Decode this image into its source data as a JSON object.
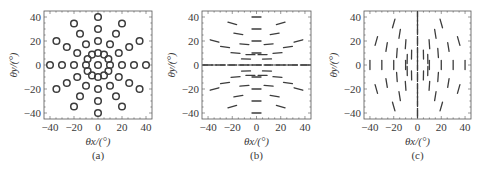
{
  "figure": {
    "panels": [
      {
        "id": "a",
        "label": "(a)",
        "xlabel": "θx/(°)",
        "ylabel": "θy/(°)"
      },
      {
        "id": "b",
        "label": "(b)",
        "xlabel": "θx/(°)",
        "ylabel": "θy/(°)"
      },
      {
        "id": "c",
        "label": "(c)",
        "xlabel": "θx/(°)",
        "ylabel": "θy/(°)"
      }
    ],
    "colors": {
      "frame": "#555555",
      "marker": "#3c3c3c",
      "text": "#3a3a3a"
    }
  },
  "chart_data": [
    {
      "type": "scatter",
      "title": "(a)",
      "xlabel": "θx/(°)",
      "ylabel": "θy/(°)",
      "xlim": [
        -45,
        45
      ],
      "ylim": [
        -45,
        45
      ],
      "xticks": [
        -40,
        -20,
        0,
        20,
        40
      ],
      "yticks": [
        -40,
        -20,
        0,
        20,
        40
      ],
      "grid": false,
      "marker": "open-circle",
      "layout": "center point, inner ring of 12 at radius 10, and 12 radial rays (every 30°) at radii 20, 30, 40",
      "rings": [
        {
          "radius": 0,
          "angles_deg": [
            0
          ]
        },
        {
          "radius": 10,
          "angles_deg": [
            0,
            30,
            60,
            90,
            120,
            150,
            180,
            210,
            240,
            270,
            300,
            330
          ]
        },
        {
          "radius": 20,
          "angles_deg": [
            0,
            30,
            60,
            90,
            120,
            150,
            180,
            210,
            240,
            270,
            300,
            330
          ]
        },
        {
          "radius": 30,
          "angles_deg": [
            0,
            30,
            60,
            90,
            120,
            150,
            180,
            210,
            240,
            270,
            300,
            330
          ]
        },
        {
          "radius": 40,
          "angles_deg": [
            0,
            30,
            60,
            90,
            120,
            150,
            180,
            210,
            240,
            270,
            300,
            330
          ]
        }
      ]
    },
    {
      "type": "scatter",
      "title": "(b)",
      "xlabel": "θx/(°)",
      "ylabel": "θy/(°)",
      "xlim": [
        -45,
        45
      ],
      "ylim": [
        -45,
        45
      ],
      "xticks": [
        -40,
        -20,
        0,
        20,
        40
      ],
      "yticks": [
        -40,
        -20,
        0,
        20,
        40
      ],
      "grid": false,
      "marker": "near-horizontal dash (polarization orientation)",
      "layout": "same sampling grid as (a); dashes mostly horizontal, tilting slightly with position"
    },
    {
      "type": "scatter",
      "title": "(c)",
      "xlabel": "θx/(°)",
      "ylabel": "θy/(°)",
      "xlim": [
        -45,
        45
      ],
      "ylim": [
        -45,
        45
      ],
      "xticks": [
        -40,
        -20,
        0,
        20,
        40
      ],
      "yticks": [
        -40,
        -20,
        0,
        20,
        40
      ],
      "grid": false,
      "marker": "near-vertical dash (polarization orientation)",
      "layout": "same sampling grid as (a); dashes mostly vertical, tilting slightly with position"
    }
  ]
}
